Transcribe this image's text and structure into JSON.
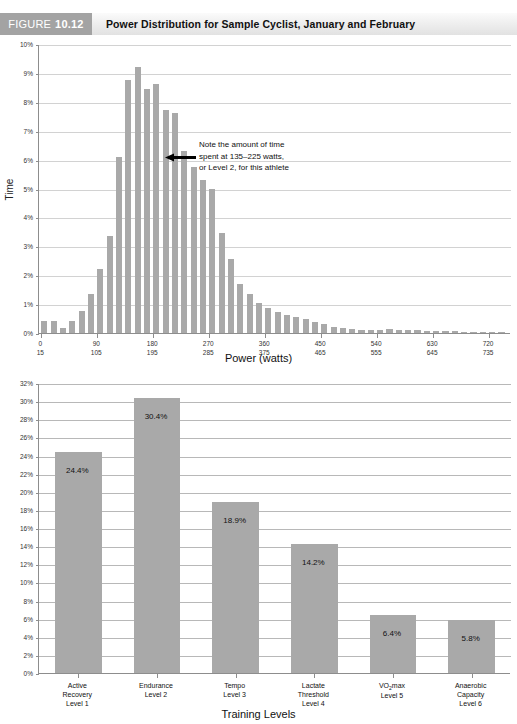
{
  "figure": {
    "badge_word": "FIGURE",
    "badge_number": "10.12",
    "title": "Power Distribution for Sample Cyclist, January and February"
  },
  "annotation": {
    "line1": "Note the amount of time",
    "line2": "spent at 135–225 watts,",
    "line3": "or Level 2, for this athlete",
    "arrow_icon": "left-arrow-icon"
  },
  "colors": {
    "bar": "#a9a9a9",
    "badge": "#a3a3a3",
    "axis": "#8d8d8d",
    "grid": "#d2d2d2"
  },
  "chart_data": [
    {
      "type": "bar",
      "id": "power-distribution-histogram",
      "title": "Power Distribution for Sample Cyclist, January and February",
      "xlabel": "Power (watts)",
      "ylabel": "Time",
      "ylim": [
        0,
        10
      ],
      "ytick_labels": [
        "0%",
        "1%",
        "2%",
        "3%",
        "4%",
        "5%",
        "6%",
        "7%",
        "8%",
        "9%",
        "10%"
      ],
      "ytick_values": [
        0,
        1,
        2,
        3,
        4,
        5,
        6,
        7,
        8,
        9,
        10
      ],
      "grid": true,
      "legend": "none",
      "xtick_labels_upper": [
        "0",
        "90",
        "180",
        "270",
        "360",
        "450",
        "540",
        "630",
        "720"
      ],
      "xtick_labels_lower": [
        "15",
        "105",
        "195",
        "285",
        "375",
        "465",
        "555",
        "645",
        "735"
      ],
      "bin_width_watts": 15,
      "x_bin_starts": [
        0,
        15,
        30,
        45,
        60,
        75,
        90,
        105,
        120,
        135,
        150,
        165,
        180,
        195,
        210,
        225,
        240,
        255,
        270,
        285,
        300,
        315,
        330,
        345,
        360,
        375,
        390,
        405,
        420,
        435,
        450,
        465,
        480,
        495,
        510,
        525,
        540,
        555,
        570,
        585,
        600,
        615,
        630,
        645,
        660,
        675,
        690,
        705,
        720,
        735
      ],
      "values": [
        0.42,
        0.4,
        0.18,
        0.4,
        0.75,
        1.35,
        2.2,
        3.35,
        6.1,
        8.75,
        9.2,
        8.45,
        8.6,
        7.7,
        7.6,
        6.3,
        5.75,
        5.3,
        5.0,
        3.45,
        2.55,
        1.7,
        1.35,
        1.05,
        0.85,
        0.72,
        0.62,
        0.55,
        0.48,
        0.38,
        0.3,
        0.22,
        0.17,
        0.14,
        0.12,
        0.1,
        0.1,
        0.13,
        0.12,
        0.1,
        0.09,
        0.07,
        0.08,
        0.07,
        0.06,
        0.05,
        0.04,
        0.03,
        0.03,
        0.02
      ]
    },
    {
      "type": "bar",
      "id": "training-level-distribution",
      "xlabel": "Training Levels",
      "ylabel": "Time",
      "ylim": [
        0,
        32
      ],
      "ytick_labels": [
        "0%",
        "2%",
        "4%",
        "6%",
        "8%",
        "10%",
        "12%",
        "14%",
        "16%",
        "18%",
        "20%",
        "22%",
        "24%",
        "26%",
        "28%",
        "30%",
        "32%"
      ],
      "ytick_values": [
        0,
        2,
        4,
        6,
        8,
        10,
        12,
        14,
        16,
        18,
        20,
        22,
        24,
        26,
        28,
        30,
        32
      ],
      "grid": true,
      "legend": "none",
      "categories": [
        "Active\nRecovery\nLevel 1",
        "Endurance\nLevel 2",
        "Tempo\nLevel 3",
        "Lactate\nThreshold\nLevel 4",
        "VO2max\nLevel 5",
        "Anaerobic\nCapacity\nLevel 6"
      ],
      "category_lines": [
        [
          "Active",
          "Recovery",
          "Level 1"
        ],
        [
          "Endurance",
          "Level 2"
        ],
        [
          "Tempo",
          "Level 3"
        ],
        [
          "Lactate",
          "Threshold",
          "Level 4"
        ],
        [
          "VO2max",
          "Level 5"
        ],
        [
          "Anaerobic",
          "Capacity",
          "Level 6"
        ]
      ],
      "values": [
        24.4,
        30.4,
        18.9,
        14.2,
        6.4,
        5.8
      ],
      "value_labels": [
        "24.4%",
        "30.4%",
        "18.9%",
        "14.2%",
        "6.4%",
        "5.8%"
      ]
    }
  ]
}
